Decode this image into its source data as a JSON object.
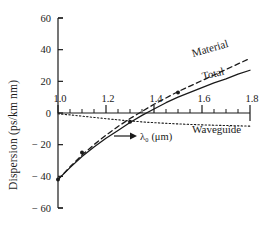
{
  "chart_data": {
    "type": "line",
    "title": "",
    "xlabel": "λ₀ (μm)",
    "ylabel": "Dispersion (ps/km nm)",
    "xlim": [
      1.0,
      1.8
    ],
    "ylim": [
      -60,
      60
    ],
    "xticks": [
      1.0,
      1.2,
      1.4,
      1.6,
      1.8
    ],
    "xticklabels": [
      "1.0",
      "1.2",
      "1.4",
      "1.6",
      "1.8"
    ],
    "yticks": [
      60,
      40,
      20,
      0,
      -20,
      -40,
      -60
    ],
    "yticklabels": [
      "60",
      "40",
      "20",
      "0",
      "− 20",
      "− 40",
      "− 60"
    ],
    "xminorticks": [
      1.05,
      1.1,
      1.15,
      1.25,
      1.3,
      1.35,
      1.45,
      1.5,
      1.55,
      1.65,
      1.7,
      1.75
    ],
    "grid": false,
    "legend_position": "inline-labels",
    "zero_line": 0,
    "series": [
      {
        "name": "Material",
        "style": "dashed",
        "x": [
          1.0,
          1.05,
          1.1,
          1.15,
          1.2,
          1.25,
          1.3,
          1.35,
          1.4,
          1.45,
          1.5,
          1.55,
          1.6,
          1.65,
          1.7,
          1.75,
          1.8
        ],
        "values": [
          -42.0,
          -34.0,
          -26.5,
          -20.0,
          -14.0,
          -8.5,
          -3.5,
          1.0,
          5.5,
          9.5,
          13.5,
          17.0,
          20.5,
          24.0,
          27.5,
          31.0,
          34.5
        ]
      },
      {
        "name": "Total",
        "style": "solid",
        "x": [
          1.0,
          1.05,
          1.1,
          1.15,
          1.2,
          1.25,
          1.3,
          1.35,
          1.4,
          1.45,
          1.5,
          1.55,
          1.6,
          1.65,
          1.7,
          1.75,
          1.8
        ],
        "values": [
          -42.0,
          -34.5,
          -27.5,
          -21.5,
          -16.0,
          -11.0,
          -6.0,
          -1.5,
          2.5,
          6.5,
          10.0,
          13.0,
          16.0,
          19.0,
          21.5,
          24.5,
          27.0
        ]
      },
      {
        "name": "Waveguide",
        "style": "dotted",
        "x": [
          1.0,
          1.05,
          1.1,
          1.15,
          1.2,
          1.25,
          1.3,
          1.35,
          1.4,
          1.45,
          1.5,
          1.55,
          1.6,
          1.65,
          1.7,
          1.75,
          1.8
        ],
        "values": [
          -0.5,
          -1.2,
          -2.0,
          -2.8,
          -3.6,
          -4.3,
          -5.0,
          -5.6,
          -6.1,
          -6.5,
          -6.9,
          -7.2,
          -7.5,
          -7.7,
          -7.9,
          -8.1,
          -8.3
        ]
      }
    ],
    "markers": [
      {
        "x": 1.0,
        "y": -42.0
      },
      {
        "x": 1.1,
        "y": -25.0
      },
      {
        "x": 1.3,
        "y": -5.5
      },
      {
        "x": 1.5,
        "y": 13.0
      }
    ],
    "curve_labels": [
      {
        "text": "Material",
        "series": "Material"
      },
      {
        "text": "Total",
        "series": "Total"
      },
      {
        "text": "Waveguide",
        "series": "Waveguide"
      }
    ],
    "annotations": [
      {
        "text": "λ₀ (μm)",
        "kind": "arrow-label",
        "points_to": "zero-dispersion-wavelength"
      }
    ],
    "colors": {
      "ink": "#1a1a1a",
      "background": "#ffffff"
    }
  }
}
